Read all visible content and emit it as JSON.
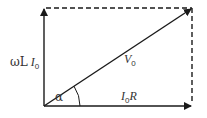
{
  "diagram": {
    "type": "phasor-diagram",
    "colors": {
      "background": "#ffffff",
      "stroke": "#1a1a1a",
      "text": "#333333"
    },
    "vectors": [
      {
        "name": "vertical",
        "label": "ωL I0",
        "from": [
          44,
          106
        ],
        "to": [
          44,
          8
        ]
      },
      {
        "name": "horizontal",
        "label": "I0R",
        "from": [
          44,
          106
        ],
        "to": [
          192,
          106
        ]
      },
      {
        "name": "resultant",
        "label": "V0",
        "from": [
          44,
          106
        ],
        "to": [
          192,
          8
        ]
      }
    ],
    "labels": {
      "vertical": {
        "prefix": "ωL",
        "main": "I",
        "sub": "0"
      },
      "resultant": {
        "main": "V",
        "sub": "0"
      },
      "horizontal": {
        "main": "I",
        "sub": "0",
        "suffix": "R"
      },
      "angle": "α"
    }
  }
}
